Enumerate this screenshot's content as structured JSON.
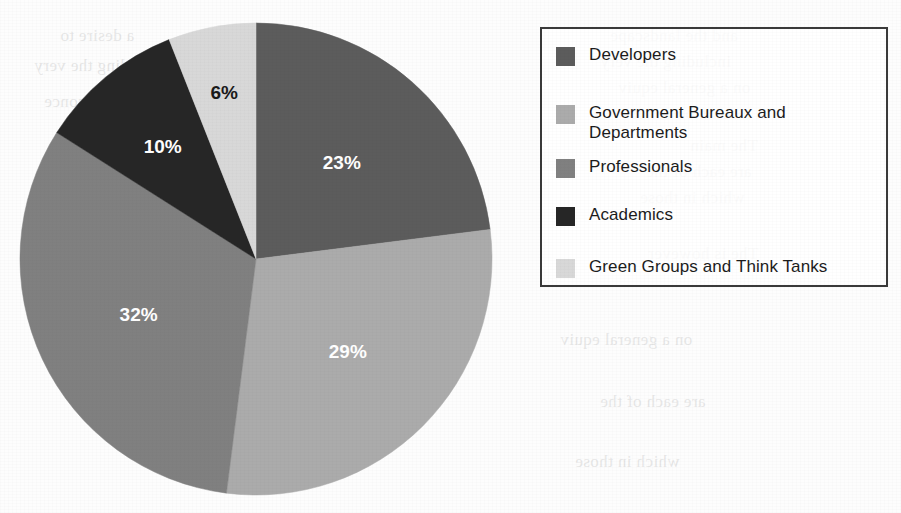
{
  "chart_data": {
    "type": "pie",
    "title": "",
    "subtitle": "",
    "xlabel": "",
    "ylabel": "",
    "categories": [
      "Developers",
      "Government Bureaux and Departments",
      "Professionals",
      "Academics",
      "Green Groups and Think Tanks"
    ],
    "values": [
      23,
      29,
      32,
      10,
      6
    ],
    "value_unit": "%",
    "data_labels": [
      "23%",
      "29%",
      "32%",
      "10%",
      "6%"
    ],
    "slice_colors": [
      "#5c5c5c",
      "#ababab",
      "#808080",
      "#262626",
      "#d8d8d8"
    ],
    "label_colors": [
      "#ffffff",
      "#ffffff",
      "#ffffff",
      "#ffffff",
      "#1a1a1a"
    ],
    "start_angle_deg": 0,
    "direction": "clockwise",
    "grid": false,
    "legend_position": "right",
    "legend": [
      {
        "label": "Developers",
        "color": "#5c5c5c"
      },
      {
        "label": "Government Bureaux and Departments",
        "color": "#ababab"
      },
      {
        "label": "Professionals",
        "color": "#808080"
      },
      {
        "label": "Academics",
        "color": "#262626"
      },
      {
        "label": "Green Groups and Think Tanks",
        "color": "#d8d8d8"
      }
    ]
  },
  "pie": {
    "slices": [
      {
        "label": "Developers",
        "percent_text": "23%",
        "value": 23,
        "color": "#5c5c5c",
        "label_color": "#ffffff"
      },
      {
        "label": "Government Bureaux and Departments",
        "percent_text": "29%",
        "value": 29,
        "color": "#ababab",
        "label_color": "#ffffff"
      },
      {
        "label": "Professionals",
        "percent_text": "32%",
        "value": 32,
        "color": "#808080",
        "label_color": "#ffffff"
      },
      {
        "label": "Academics",
        "percent_text": "10%",
        "value": 10,
        "color": "#262626",
        "label_color": "#ffffff"
      },
      {
        "label": "Green Groups and Think Tanks",
        "percent_text": "6%",
        "value": 6,
        "color": "#d8d8d8",
        "label_color": "#1a1a1a"
      }
    ]
  },
  "legend": {
    "items": [
      {
        "label": "Developers",
        "color": "#5c5c5c"
      },
      {
        "label": "Government Bureaux and Departments",
        "color": "#ababab"
      },
      {
        "label": "Professionals",
        "color": "#808080"
      },
      {
        "label": "Academics",
        "color": "#262626"
      },
      {
        "label": "Green Groups and Think Tanks",
        "color": "#d8d8d8"
      }
    ]
  },
  "background_bleed_text": [
    "and the landscape",
    "including the very",
    "on a general equiv",
    "in a common conce",
    "The main",
    "are each of the",
    "which in those",
    "The is however",
    "a desire to"
  ]
}
